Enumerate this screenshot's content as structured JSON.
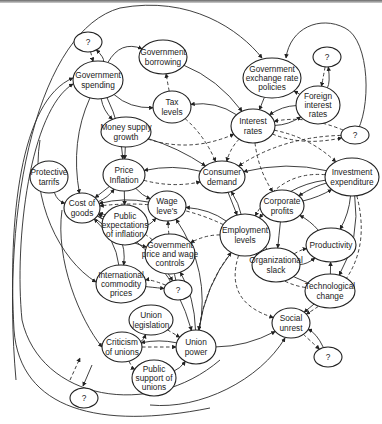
{
  "diagram": {
    "type": "causal-loop",
    "nodes": [
      {
        "id": "q1",
        "lines": [
          "?"
        ],
        "cx": 88,
        "cy": 42,
        "rx": 14,
        "ry": 10
      },
      {
        "id": "gov_spending",
        "lines": [
          "Government",
          "spending"
        ],
        "cx": 98,
        "cy": 80,
        "rx": 25,
        "ry": 19
      },
      {
        "id": "gov_borrowing",
        "lines": [
          "Government",
          "borrowing"
        ],
        "cx": 163,
        "cy": 57,
        "rx": 24,
        "ry": 17
      },
      {
        "id": "tax_levels",
        "lines": [
          "Tax",
          "levels"
        ],
        "cx": 172,
        "cy": 107,
        "rx": 19,
        "ry": 16
      },
      {
        "id": "gov_exchange",
        "lines": [
          "Government",
          "exchange rate",
          "policies"
        ],
        "cx": 272,
        "cy": 78,
        "rx": 29,
        "ry": 20
      },
      {
        "id": "q2",
        "lines": [
          "?"
        ],
        "cx": 327,
        "cy": 57,
        "rx": 14,
        "ry": 10
      },
      {
        "id": "foreign_interest",
        "lines": [
          "Foreign",
          "interest",
          "rates"
        ],
        "cx": 318,
        "cy": 105,
        "rx": 22,
        "ry": 19
      },
      {
        "id": "money_supply",
        "lines": [
          "Money supply",
          "growth"
        ],
        "cx": 126,
        "cy": 132,
        "rx": 25,
        "ry": 15
      },
      {
        "id": "interest_rates",
        "lines": [
          "Interest",
          "rates"
        ],
        "cx": 253,
        "cy": 126,
        "rx": 22,
        "ry": 17
      },
      {
        "id": "q3",
        "lines": [
          "?"
        ],
        "cx": 355,
        "cy": 135,
        "rx": 14,
        "ry": 9
      },
      {
        "id": "protective_tariffs",
        "lines": [
          "Protective",
          "tarrifs"
        ],
        "cx": 49,
        "cy": 177,
        "rx": 19,
        "ry": 16
      },
      {
        "id": "price_inflation",
        "lines": [
          "Price",
          "Inflation"
        ],
        "cx": 124,
        "cy": 175,
        "rx": 21,
        "ry": 16
      },
      {
        "id": "consumer_demand",
        "lines": [
          "Consumer",
          "demand"
        ],
        "cx": 222,
        "cy": 177,
        "rx": 23,
        "ry": 16
      },
      {
        "id": "investment_exp",
        "lines": [
          "Investment",
          "expenditure"
        ],
        "cx": 352,
        "cy": 177,
        "rx": 27,
        "ry": 19
      },
      {
        "id": "cost_of_goods",
        "lines": [
          "Cost of",
          "goods"
        ],
        "cx": 82,
        "cy": 208,
        "rx": 18,
        "ry": 15
      },
      {
        "id": "wage_levels",
        "lines": [
          "Wage",
          "leve's"
        ],
        "cx": 167,
        "cy": 206,
        "rx": 19,
        "ry": 15
      },
      {
        "id": "corporate_profits",
        "lines": [
          "Corporate",
          "profits"
        ],
        "cx": 282,
        "cy": 206,
        "rx": 22,
        "ry": 16
      },
      {
        "id": "public_expectations",
        "lines": [
          "Public",
          "expectations",
          "of inflation"
        ],
        "cx": 125,
        "cy": 225,
        "rx": 23,
        "ry": 20
      },
      {
        "id": "employment_levels",
        "lines": [
          "Employment",
          "levels"
        ],
        "cx": 245,
        "cy": 235,
        "rx": 25,
        "ry": 21
      },
      {
        "id": "productivity",
        "lines": [
          "Productivity"
        ],
        "cx": 331,
        "cy": 245,
        "rx": 25,
        "ry": 17
      },
      {
        "id": "gov_price_wage",
        "lines": [
          "Government",
          "price and wage",
          "controls"
        ],
        "cx": 170,
        "cy": 254,
        "rx": 25,
        "ry": 20
      },
      {
        "id": "org_slack",
        "lines": [
          "Organizational",
          "slack"
        ],
        "cx": 276,
        "cy": 265,
        "rx": 24,
        "ry": 17
      },
      {
        "id": "intl_commodity",
        "lines": [
          "International",
          "commodity",
          "prices"
        ],
        "cx": 121,
        "cy": 284,
        "rx": 25,
        "ry": 19
      },
      {
        "id": "q4",
        "lines": [
          "?"
        ],
        "cx": 178,
        "cy": 290,
        "rx": 14,
        "ry": 10
      },
      {
        "id": "tech_change",
        "lines": [
          "Technological",
          "change"
        ],
        "cx": 330,
        "cy": 291,
        "rx": 25,
        "ry": 17
      },
      {
        "id": "union_legislation",
        "lines": [
          "Union",
          "legislation"
        ],
        "cx": 151,
        "cy": 320,
        "rx": 22,
        "ry": 15
      },
      {
        "id": "social_unrest",
        "lines": [
          "Social",
          "unrest"
        ],
        "cx": 291,
        "cy": 323,
        "rx": 19,
        "ry": 15
      },
      {
        "id": "criticism_unions",
        "lines": [
          "Criticism",
          "of unions"
        ],
        "cx": 122,
        "cy": 347,
        "rx": 20,
        "ry": 15
      },
      {
        "id": "union_power",
        "lines": [
          "Union",
          "power"
        ],
        "cx": 196,
        "cy": 347,
        "rx": 20,
        "ry": 17
      },
      {
        "id": "q5",
        "lines": [
          "?"
        ],
        "cx": 328,
        "cy": 357,
        "rx": 14,
        "ry": 10
      },
      {
        "id": "public_support",
        "lines": [
          "Public",
          "support of",
          "unions"
        ],
        "cx": 154,
        "cy": 378,
        "rx": 22,
        "ry": 18
      },
      {
        "id": "q6",
        "lines": [
          "?"
        ],
        "cx": 84,
        "cy": 398,
        "rx": 14,
        "ry": 10
      }
    ],
    "edges": [
      {
        "from": "gov_spending",
        "to": "gov_borrowing",
        "style": "solid",
        "bend": -15
      },
      {
        "from": "gov_spending",
        "to": "tax_levels",
        "style": "solid",
        "bend": 8
      },
      {
        "from": "gov_spending",
        "to": "money_supply",
        "style": "solid",
        "bend": 5
      },
      {
        "from": "gov_spending",
        "to": "price_inflation",
        "style": "solid",
        "bend": -5
      },
      {
        "from": "q1",
        "to": "gov_spending",
        "style": "dashed",
        "bend": 0
      },
      {
        "from": "gov_spending",
        "to": "q1",
        "style": "solid",
        "bend": 6
      },
      {
        "from": "gov_borrowing",
        "to": "interest_rates",
        "style": "solid",
        "bend": -8
      },
      {
        "from": "tax_levels",
        "to": "gov_borrowing",
        "style": "dashed",
        "bend": 0
      },
      {
        "from": "tax_levels",
        "to": "consumer_demand",
        "style": "dashed",
        "bend": -5
      },
      {
        "from": "interest_rates",
        "to": "tax_levels",
        "style": "solid",
        "bend": 8
      },
      {
        "from": "gov_exchange",
        "to": "interest_rates",
        "style": "solid",
        "bend": 0
      },
      {
        "from": "foreign_interest",
        "to": "gov_exchange",
        "style": "solid",
        "bend": 0
      },
      {
        "from": "q2",
        "to": "foreign_interest",
        "style": "dashed",
        "bend": 0
      },
      {
        "from": "foreign_interest",
        "to": "q2",
        "style": "solid",
        "bend": 4
      },
      {
        "from": "foreign_interest",
        "to": "interest_rates",
        "style": "solid",
        "bend": 5
      },
      {
        "from": "interest_rates",
        "to": "foreign_interest",
        "style": "solid",
        "bend": 5
      },
      {
        "from": "money_supply",
        "to": "interest_rates",
        "style": "dashed",
        "bend": 12
      },
      {
        "from": "money_supply",
        "to": "price_inflation",
        "style": "solid",
        "bend": 0
      },
      {
        "from": "money_supply",
        "to": "consumer_demand",
        "style": "solid",
        "bend": -4
      },
      {
        "from": "interest_rates",
        "to": "consumer_demand",
        "style": "dashed",
        "bend": 4
      },
      {
        "from": "interest_rates",
        "to": "investment_exp",
        "style": "dashed",
        "bend": -8
      },
      {
        "from": "interest_rates",
        "to": "corporate_profits",
        "style": "dashed",
        "bend": 5
      },
      {
        "from": "q3",
        "to": "interest_rates",
        "style": "dashed",
        "bend": 8
      },
      {
        "from": "interest_rates",
        "to": "q3",
        "style": "dashed",
        "bend": 8
      },
      {
        "from": "q3",
        "to": "consumer_demand",
        "style": "dashed",
        "bend": 10
      },
      {
        "from": "consumer_demand",
        "to": "price_inflation",
        "style": "solid",
        "bend": 6
      },
      {
        "from": "price_inflation",
        "to": "consumer_demand",
        "style": "dashed",
        "bend": 6
      },
      {
        "from": "investment_exp",
        "to": "consumer_demand",
        "style": "solid",
        "bend": 8
      },
      {
        "from": "consumer_demand",
        "to": "employment_levels",
        "style": "solid",
        "bend": 0
      },
      {
        "from": "employment_levels",
        "to": "consumer_demand",
        "style": "solid",
        "bend": 3
      },
      {
        "from": "investment_exp",
        "to": "corporate_profits",
        "style": "solid",
        "bend": 3
      },
      {
        "from": "corporate_profits",
        "to": "investment_exp",
        "style": "solid",
        "bend": 3
      },
      {
        "from": "investment_exp",
        "to": "productivity",
        "style": "solid",
        "bend": -4
      },
      {
        "from": "investment_exp",
        "to": "employment_levels",
        "style": "solid",
        "bend": 12
      },
      {
        "from": "investment_exp",
        "to": "employment_levels",
        "style": "dashed",
        "bend": 20
      },
      {
        "from": "corporate_profits",
        "to": "org_slack",
        "style": "solid",
        "bend": 0
      },
      {
        "from": "productivity",
        "to": "corporate_profits",
        "style": "solid",
        "bend": 3
      },
      {
        "from": "org_slack",
        "to": "productivity",
        "style": "dashed",
        "bend": -3
      },
      {
        "from": "org_slack",
        "to": "productivity",
        "style": "solid",
        "bend": 5
      },
      {
        "from": "org_slack",
        "to": "employment_levels",
        "style": "solid",
        "bend": 3
      },
      {
        "from": "tech_change",
        "to": "productivity",
        "style": "solid",
        "bend": 0
      },
      {
        "from": "tech_change",
        "to": "employment_levels",
        "style": "dashed",
        "bend": -12
      },
      {
        "from": "tech_change",
        "to": "employment_levels",
        "style": "solid",
        "bend": -6
      },
      {
        "from": "investment_exp",
        "to": "tech_change",
        "style": "solid",
        "bend": -10
      },
      {
        "from": "tech_change",
        "to": "social_unrest",
        "style": "solid",
        "bend": 0
      },
      {
        "from": "social_unrest",
        "to": "q5",
        "style": "dashed",
        "bend": 0
      },
      {
        "from": "q5",
        "to": "social_unrest",
        "style": "solid",
        "bend": 5
      },
      {
        "from": "employment_levels",
        "to": "social_unrest",
        "style": "dashed",
        "bend": 25
      },
      {
        "from": "investment_exp",
        "to": "social_unrest",
        "style": "dashed",
        "bend": -30
      },
      {
        "from": "protective_tariffs",
        "to": "cost_of_goods",
        "style": "solid",
        "bend": 6
      },
      {
        "from": "price_inflation",
        "to": "cost_of_goods",
        "style": "solid",
        "bend": 0
      },
      {
        "from": "cost_of_goods",
        "to": "price_inflation",
        "style": "solid",
        "bend": 4
      },
      {
        "from": "price_inflation",
        "to": "public_expectations",
        "style": "solid",
        "bend": 0
      },
      {
        "from": "price_inflation",
        "to": "wage_levels",
        "style": "solid",
        "bend": 3
      },
      {
        "from": "wage_levels",
        "to": "cost_of_goods",
        "style": "solid",
        "bend": 5
      },
      {
        "from": "public_expectations",
        "to": "wage_levels",
        "style": "solid",
        "bend": 5
      },
      {
        "from": "public_expectations",
        "to": "cost_of_goods",
        "style": "solid",
        "bend": 0
      },
      {
        "from": "employment_levels",
        "to": "wage_levels",
        "style": "solid",
        "bend": 6
      },
      {
        "from": "employment_levels",
        "to": "cost_of_goods",
        "style": "dashed",
        "bend": 12
      },
      {
        "from": "gov_price_wage",
        "to": "wage_levels",
        "style": "dashed",
        "bend": 0
      },
      {
        "from": "gov_price_wage",
        "to": "cost_of_goods",
        "style": "dashed",
        "bend": 5
      },
      {
        "from": "cost_of_goods",
        "to": "gov_price_wage",
        "style": "solid",
        "bend": 5
      },
      {
        "from": "employment_levels",
        "to": "gov_price_wage",
        "style": "dashed",
        "bend": 5
      },
      {
        "from": "q4",
        "to": "gov_price_wage",
        "style": "solid",
        "bend": 0
      },
      {
        "from": "gov_price_wage",
        "to": "q4",
        "style": "solid",
        "bend": 3
      },
      {
        "from": "intl_commodity",
        "to": "q4",
        "style": "solid",
        "bend": 0
      },
      {
        "from": "q4",
        "to": "intl_commodity",
        "style": "dashed",
        "bend": 4
      },
      {
        "from": "intl_commodity",
        "to": "cost_of_goods",
        "style": "solid",
        "bend": 8
      },
      {
        "from": "cost_of_goods",
        "to": "intl_commodity",
        "style": "solid",
        "bend": -15
      },
      {
        "from": "union_legislation",
        "to": "union_power",
        "style": "dashed",
        "bend": 0
      },
      {
        "from": "criticism_unions",
        "to": "union_legislation",
        "style": "solid",
        "bend": 5
      },
      {
        "from": "criticism_unions",
        "to": "union_power",
        "style": "dashed",
        "bend": 0
      },
      {
        "from": "union_power",
        "to": "criticism_unions",
        "style": "solid",
        "bend": 4
      },
      {
        "from": "criticism_unions",
        "to": "public_support",
        "style": "dashed",
        "bend": 4
      },
      {
        "from": "public_support",
        "to": "union_power",
        "style": "solid",
        "bend": 4
      },
      {
        "from": "union_power",
        "to": "social_unrest",
        "style": "solid",
        "bend": 6
      },
      {
        "from": "union_power",
        "to": "wage_levels",
        "style": "solid",
        "bend": 15
      },
      {
        "from": "union_power",
        "to": "gov_price_wage",
        "style": "solid",
        "bend": 6
      },
      {
        "from": "union_power",
        "to": "employment_levels",
        "style": "solid",
        "bend": -8
      },
      {
        "from": "employment_levels",
        "to": "union_power",
        "style": "dashed",
        "bend": 8
      },
      {
        "from": "gov_spending",
        "to": "cost_of_goods",
        "style": "solid",
        "bend": 10
      },
      {
        "from": "cost_of_goods",
        "to": "union_power",
        "style": "solid",
        "bend": -20
      }
    ],
    "long_curves": [
      {
        "id": "top_loop",
        "d": "M 16 380 C 0 200, 40 30, 120 8 C 190 -5, 240 30, 262 58",
        "style": "solid",
        "arrow_end": true
      },
      {
        "id": "right_loop_q2",
        "d": "M 355 135 C 372 110, 370 40, 345 28 C 320 15, 290 28, 286 58",
        "style": "solid",
        "arrow_end": true
      },
      {
        "id": "left_outer_to_spending",
        "d": "M 210 408 C 100 430, 20 410, 14 330 C 8 220, 20 100, 73 78",
        "style": "solid",
        "arrow_end": true
      },
      {
        "id": "left_inner_to_spending",
        "d": "M 220 360 C 150 420, 40 400, 22 320 C 14 240, 30 110, 73 84",
        "style": "solid",
        "arrow_end": true
      },
      {
        "id": "left_to_intl",
        "d": "M 40 140 C 30 200, 60 260, 96 282",
        "style": "solid",
        "arrow_end": true
      },
      {
        "id": "left_to_criticism",
        "d": "M 62 210 C 55 260, 80 320, 102 347",
        "style": "solid",
        "arrow_end": true
      },
      {
        "id": "bottom_to_social",
        "d": "M 150 405 C 200 410, 260 380, 285 338",
        "style": "solid",
        "arrow_end": true
      },
      {
        "id": "q6_link_a",
        "d": "M 70 380 L 80 358",
        "style": "dashed",
        "arrow_end": true
      },
      {
        "id": "q6_link_b",
        "d": "M 92 365 L 83 386",
        "style": "solid",
        "arrow_end": true
      }
    ]
  }
}
